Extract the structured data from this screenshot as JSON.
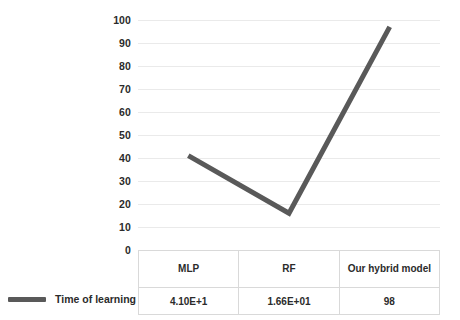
{
  "chart_data": {
    "type": "line",
    "title": "",
    "xlabel": "",
    "ylabel": "",
    "ylim": [
      0,
      100
    ],
    "grid": true,
    "legend_position": "bottom-left",
    "categories": [
      "MLP",
      "RF",
      "Our hybrid model"
    ],
    "series": [
      {
        "name": "Time of learning",
        "color": "#595959",
        "values": [
          41,
          16,
          97
        ],
        "labels": [
          "4.10E+1",
          "1.66E+01",
          "98"
        ]
      }
    ],
    "y_ticks": [
      100,
      90,
      80,
      70,
      60,
      50,
      40,
      30,
      20,
      10,
      0
    ]
  },
  "axis": {
    "y_ticks": [
      {
        "label": "100",
        "value": 100
      },
      {
        "label": "90",
        "value": 90
      },
      {
        "label": "80",
        "value": 80
      },
      {
        "label": "70",
        "value": 70
      },
      {
        "label": "60",
        "value": 60
      },
      {
        "label": "50",
        "value": 50
      },
      {
        "label": "40",
        "value": 40
      },
      {
        "label": "30",
        "value": 30
      },
      {
        "label": "20",
        "value": 20
      },
      {
        "label": "10",
        "value": 10
      },
      {
        "label": "0",
        "value": 0
      }
    ]
  },
  "table": {
    "headers": [
      "MLP",
      "RF",
      "Our hybrid model"
    ],
    "rows": [
      {
        "label": "Time of learning",
        "cells": [
          "4.10E+1",
          "1.66E+01",
          "98"
        ]
      }
    ]
  },
  "legend": {
    "entries": [
      {
        "label": "Time of learning",
        "color": "#595959"
      }
    ]
  },
  "colors": {
    "series": "#595959",
    "gridline": "#eaeaea",
    "table_border": "#d9d9d9",
    "text": "#2b2b2b",
    "background": "#ffffff"
  }
}
